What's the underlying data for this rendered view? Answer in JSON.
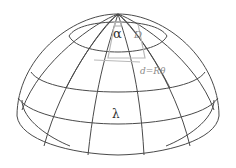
{
  "diagram": {
    "labels": {
      "alpha": "α",
      "theta_faint": "D",
      "distance": "d=Rθ",
      "lambda": "λ"
    },
    "colors": {
      "line": "#4a4a4a",
      "construction": "#b0b0b0",
      "label": "#333333"
    }
  }
}
